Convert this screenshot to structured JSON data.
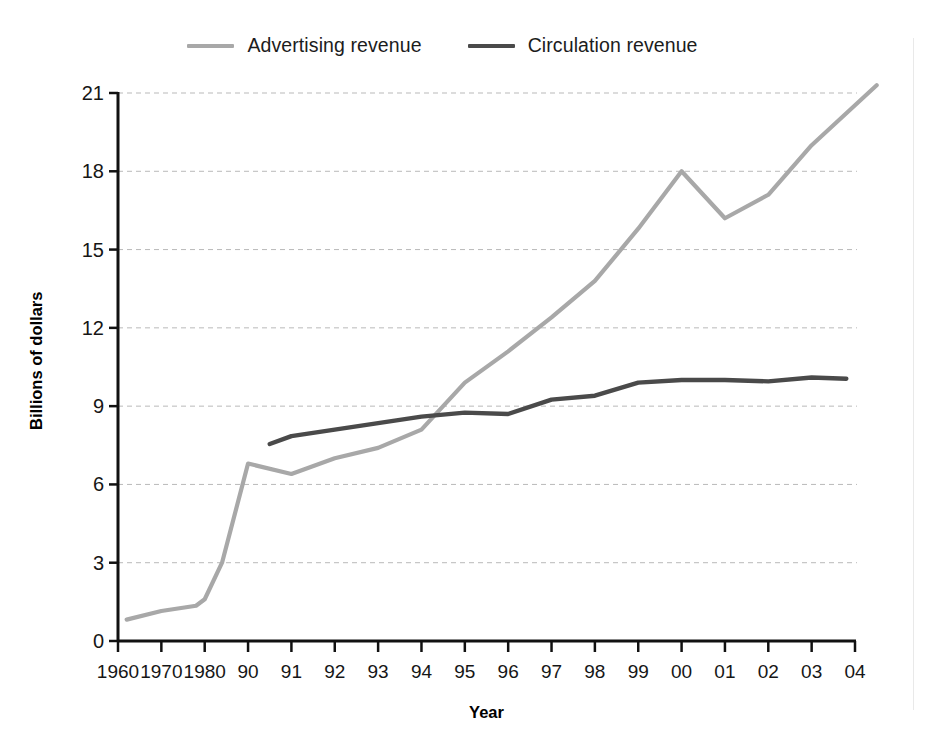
{
  "chart_data": {
    "type": "line",
    "title": "",
    "xlabel": "Year",
    "ylabel": "Billions of dollars",
    "ylim": [
      0,
      21
    ],
    "yticks": [
      0,
      3,
      6,
      9,
      12,
      15,
      18,
      21
    ],
    "ytick_labels": [
      "0",
      "3",
      "6",
      "9",
      "12",
      "15",
      "18",
      "21"
    ],
    "xtick_labels": [
      "1960",
      "1970",
      "1980",
      "90",
      "91",
      "92",
      "93",
      "94",
      "95",
      "96",
      "97",
      "98",
      "99",
      "00",
      "01",
      "02",
      "03",
      "04"
    ],
    "x": [
      1960,
      1970,
      1980,
      1990,
      1991,
      1992,
      1993,
      1994,
      1995,
      1996,
      1997,
      1998,
      1999,
      2000,
      2001,
      2002,
      2003,
      2004
    ],
    "grid": "horizontal-dashed",
    "legend_position": "top-center",
    "series": [
      {
        "name": "Advertising revenue",
        "color": "#a8a8a8",
        "x": [
          1962,
          1970,
          1978,
          1980,
          1984,
          1990,
          1991,
          1992,
          1993,
          1994,
          1995,
          1996,
          1997,
          1998,
          1999,
          2000,
          2001,
          2002,
          2003,
          2004.5
        ],
        "values": [
          0.82,
          1.15,
          1.35,
          1.6,
          3.0,
          6.8,
          6.4,
          7.0,
          7.4,
          8.1,
          9.9,
          11.1,
          12.4,
          13.8,
          15.8,
          18.0,
          16.2,
          17.1,
          19.0,
          21.3
        ]
      },
      {
        "name": "Circulation revenue",
        "color": "#4a4a4a",
        "x": [
          1990.5,
          1991,
          1992,
          1993,
          1994,
          1995,
          1996,
          1997,
          1998,
          1999,
          2000,
          2001,
          2002,
          2003,
          2003.8
        ],
        "values": [
          7.55,
          7.85,
          8.1,
          8.35,
          8.6,
          8.75,
          8.7,
          9.25,
          9.4,
          9.9,
          10.0,
          10.0,
          9.95,
          10.1,
          10.05
        ]
      }
    ]
  },
  "legend": {
    "items": [
      {
        "label": "Advertising revenue",
        "color": "#a8a8a8"
      },
      {
        "label": "Circulation revenue",
        "color": "#4a4a4a"
      }
    ]
  },
  "axes": {
    "y_title": "Billions of dollars",
    "x_title": "Year"
  }
}
